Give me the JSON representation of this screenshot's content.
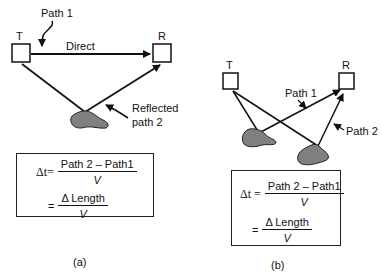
{
  "panel_a": {
    "transmitter": "T",
    "receiver": "R",
    "path1_label": "Path 1",
    "direct_label": "Direct",
    "reflected_label_line1": "Reflected",
    "reflected_label_line2": "path 2",
    "eq1_lhs": "Δt=",
    "eq1_num": "Path 2 – Path1",
    "eq1_den": "V",
    "eq2_lhs": "=",
    "eq2_num": "Δ Length",
    "eq2_den": "V",
    "caption": "(a)"
  },
  "panel_b": {
    "transmitter": "T",
    "receiver": "R",
    "path1_label": "Path 1",
    "path2_label": "Path 2",
    "eq1_lhs": "Δt =",
    "eq1_num": "Path 2 – Path1",
    "eq1_den": "V",
    "eq2_lhs": "=",
    "eq2_num": "Δ Length",
    "eq2_den": "V",
    "caption": "(b)"
  },
  "colors": {
    "line": "#111111",
    "reflector_fill": "#808080"
  }
}
